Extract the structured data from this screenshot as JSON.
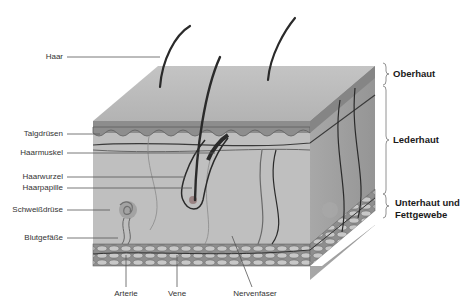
{
  "diagram": {
    "type": "skin-cross-section",
    "colors": {
      "background": "#ffffff",
      "surface_top": "#b9b9b9",
      "epidermis_band": "#8f8f8f",
      "dermis": "#bdbdbd",
      "dermis_side": "#a9a9a9",
      "fat_layer": "#9a9a9a",
      "hair": "#2a2a2a",
      "vessel": "#3a3a3a",
      "label_text": "#333333",
      "leader_line": "#555555"
    },
    "left_labels": [
      {
        "id": "haar",
        "text": "Haar"
      },
      {
        "id": "talgdruesen",
        "text": "Talgdrüsen"
      },
      {
        "id": "haarmuskel",
        "text": "Haarmuskel"
      },
      {
        "id": "haarwurzel",
        "text": "Haarwurzel"
      },
      {
        "id": "haarpapille",
        "text": "Haarpapille"
      },
      {
        "id": "schweissdruese",
        "text": "Schweißdrüse"
      },
      {
        "id": "blutgefaesse",
        "text": "Blutgefäße"
      }
    ],
    "bottom_labels": [
      {
        "id": "arterie",
        "text": "Arterie"
      },
      {
        "id": "vene",
        "text": "Vene"
      },
      {
        "id": "nervenfaser",
        "text": "Nervenfaser"
      }
    ],
    "layers": [
      {
        "id": "oberhaut",
        "text": "Oberhaut"
      },
      {
        "id": "lederhaut",
        "text": "Lederhaut"
      },
      {
        "id": "unterhaut",
        "text": "Unterhaut und\nFettgewebe",
        "line1": "Unterhaut und",
        "line2": "Fettgewebe"
      }
    ]
  }
}
